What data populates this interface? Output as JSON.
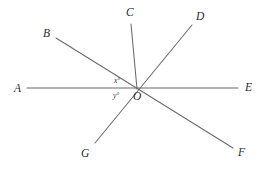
{
  "figure": {
    "kind": "geometry-diagram",
    "background_color": "#ffffff",
    "line_color": "#6a6a6a",
    "line_width": 1,
    "label_color": "#2b2b2b",
    "vertex": {
      "name": "O",
      "x": 137,
      "y": 89
    },
    "lines": [
      {
        "name": "line-AE",
        "from": "A",
        "to": "E",
        "x1": 27,
        "y1": 88,
        "x2": 238,
        "y2": 88
      },
      {
        "name": "line-BF",
        "from": "B",
        "to": "F",
        "x1": 56,
        "y1": 38,
        "x2": 233,
        "y2": 148
      },
      {
        "name": "line-GD",
        "from": "G",
        "to": "D",
        "x1": 95,
        "y1": 143,
        "x2": 192,
        "y2": 25
      },
      {
        "name": "ray-OC",
        "from": "O",
        "to": "C",
        "x1": 137,
        "y1": 89,
        "x2": 131,
        "y2": 24
      }
    ],
    "point_labels": [
      {
        "name": "label-A",
        "text": "A",
        "x": 14,
        "y": 84
      },
      {
        "name": "label-B",
        "text": "B",
        "x": 43,
        "y": 29
      },
      {
        "name": "label-C",
        "text": "C",
        "x": 126,
        "y": 8
      },
      {
        "name": "label-D",
        "text": "D",
        "x": 196,
        "y": 12
      },
      {
        "name": "label-E",
        "text": "E",
        "x": 245,
        "y": 83
      },
      {
        "name": "label-F",
        "text": "F",
        "x": 238,
        "y": 148
      },
      {
        "name": "label-G",
        "text": "G",
        "x": 81,
        "y": 149
      },
      {
        "name": "label-O",
        "text": "O",
        "x": 133,
        "y": 92
      }
    ],
    "angle_labels": [
      {
        "name": "angle-x",
        "text": "x°",
        "x": 114,
        "y": 76
      },
      {
        "name": "angle-y",
        "text": "y°",
        "x": 113,
        "y": 91
      }
    ]
  }
}
